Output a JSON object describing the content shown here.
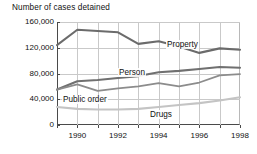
{
  "chart_data": {
    "type": "line",
    "title": "Number of cases detained",
    "xlabel": "",
    "ylabel": "",
    "ylim": [
      0,
      160000
    ],
    "xlim": [
      1989,
      1998
    ],
    "grid": true,
    "legend_position": "inline-labels",
    "x": [
      1989,
      1990,
      1991,
      1992,
      1993,
      1994,
      1995,
      1996,
      1997,
      1998
    ],
    "ytick_labels": [
      "160,000",
      "120,000",
      "80,000",
      "40,000",
      "0"
    ],
    "ytick_values": [
      160000,
      120000,
      80000,
      40000,
      0
    ],
    "xtick_labels": [
      "1990",
      "1992",
      "1994",
      "1996",
      "1998"
    ],
    "xtick_values": [
      1990,
      1992,
      1994,
      1996,
      1998
    ],
    "series": [
      {
        "name": "Property",
        "color": "#6b6b6b",
        "width": 2.1,
        "label": "Property",
        "values": [
          124000,
          148000,
          146000,
          144000,
          126000,
          130000,
          122000,
          112000,
          119000,
          117000
        ]
      },
      {
        "name": "Person",
        "color": "#707070",
        "width": 2.1,
        "label": "Person",
        "values": [
          55000,
          68000,
          70000,
          73000,
          76000,
          82000,
          84000,
          87000,
          90000,
          89000
        ]
      },
      {
        "name": "Public order",
        "color": "#8c8c8c",
        "width": 1.8,
        "label": "Public order",
        "values": [
          55000,
          63000,
          53000,
          57000,
          60000,
          65000,
          60000,
          66000,
          77000,
          79000
        ]
      },
      {
        "name": "Drugs",
        "color": "#c4c4c4",
        "width": 2.1,
        "label": "Drugs",
        "values": [
          28000,
          25000,
          24000,
          24000,
          25000,
          28000,
          31000,
          34000,
          38000,
          43000
        ]
      }
    ],
    "series_label_positions": [
      {
        "name": "Property",
        "left": 166,
        "top": 40
      },
      {
        "name": "Person",
        "left": 118,
        "top": 68
      },
      {
        "name": "Public order",
        "left": 62,
        "top": 95
      },
      {
        "name": "Drugs",
        "left": 149,
        "top": 110
      }
    ]
  }
}
